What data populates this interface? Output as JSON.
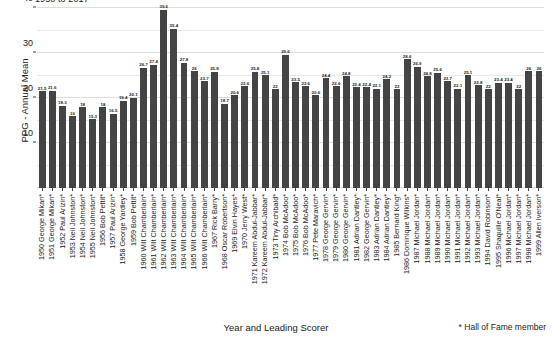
{
  "chart_data": {
    "type": "bar",
    "title": "1950 to 2017",
    "xlabel": "Year and Leading Scorer",
    "ylabel": "PPG - Annual Mean",
    "ylim": [
      0,
      40
    ],
    "yticks": [
      0,
      10,
      20,
      30,
      40
    ],
    "grid": true,
    "legend": null,
    "footnote": "* Hall of Fame member",
    "bar_color": "#444444",
    "categories": [
      "1950 George Mikan*",
      "1951 George Mikan*",
      "1952 Paul Arizin*",
      "1953 Neil Johnston*",
      "1954 Neil Johnston*",
      "1955 Neil Johnston*",
      "1956 Bob Pettit*",
      "1957 Paul Arizin*",
      "1958 George Yardley*",
      "1959 Bob Pettit*",
      "1960 Wilt Chamberlain*",
      "1961 Wilt Chamberlain*",
      "1962 Wilt Chamberlain*",
      "1963 Wilt Chamberlain*",
      "1964 Wilt Chamberlain*",
      "1965 Wilt Chamberlain*",
      "1966 Wilt Chamberlain*",
      "1967 Rick Barry*",
      "1968 Oscar Robertson*",
      "1969 Elvin Hayes*",
      "1970 Jerry West*",
      "1971 Kareem Abdul-Jabbar*",
      "1972 Kareem Abdul-Jabbar*",
      "1973 Tiny Archibald*",
      "1974 Bob McAdoo*",
      "1975 Bob McAdoo*",
      "1976 Bob McAdoo*",
      "1977 Pete Maravich*",
      "1978 George Gervin*",
      "1979 George Gervin*",
      "1980 George Gervin*",
      "1981 Adrian Dantley*",
      "1982 George Gervin*",
      "1983 Adrian Dantley*",
      "1984 Adrian Dantley*",
      "1985 Bernard King*",
      "1986 Dominique Wilkins*",
      "1987 Michael Jordan*",
      "1988 Michael Jordan*",
      "1989 Michael Jordan*",
      "1990 Michael Jordan*",
      "1991 Michael Jordan*",
      "1992 Michael Jordan*",
      "1993 Michael Jordan*",
      "1994 David Robinson*",
      "1995 Shaquille O'Neal*",
      "1996 Michael Jordan*",
      "1997 Michael Jordan*",
      "1998 Michael Jordan*",
      "1999 Allen Iverson*"
    ],
    "values": [
      21.5,
      21.6,
      18.3,
      16,
      18,
      15.3,
      18,
      16.5,
      19.4,
      20.1,
      26.7,
      27.4,
      39.6,
      35.4,
      27.8,
      26,
      23.7,
      25.8,
      18.7,
      20.6,
      22.6,
      25.8,
      25.1,
      22,
      29.6,
      23.5,
      22.6,
      20.6,
      24.4,
      22.6,
      24.8,
      22.4,
      22.4,
      22.1,
      24.2,
      22,
      28.6,
      26.9,
      24.8,
      25.6,
      23.7,
      22.1,
      25.1,
      22.8,
      22,
      23.4,
      23.4,
      22,
      26,
      26
    ],
    "value_labels": [
      "21.5",
      "21.6",
      "18.3",
      "16",
      "18",
      "15.3",
      "18",
      "16.5",
      "19.4",
      "20.1",
      "26.7",
      "27.4",
      "39.6",
      "35.4",
      "27.8",
      "26",
      "23.7",
      "25.8",
      "18.7",
      "20.6",
      "22.6",
      "25.8",
      "25.1",
      "22",
      "29.6",
      "23.5",
      "22.6",
      "20.6",
      "24.4",
      "22.6",
      "24.8",
      "22.4",
      "22.4",
      "22.1",
      "24.2",
      "22",
      "28.6",
      "26.9",
      "24.8",
      "25.6",
      "23.7",
      "22.1",
      "25.1",
      "22.8",
      "22",
      "23.4",
      "23.4",
      "22",
      "26",
      "26"
    ]
  }
}
